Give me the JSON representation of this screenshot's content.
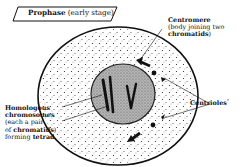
{
  "title": {
    "bold": "Prophase",
    "rest": " (early stage)"
  },
  "labels": {
    "centromere": {
      "title": "Centromere",
      "line1": "(body joining two",
      "line2_bold": "chromatids",
      "line2_rest": ")"
    },
    "centrioles": {
      "title": "Centrioles",
      "suffix": "*"
    },
    "homologous": {
      "line1": "Homologous",
      "line2": "chromosomes",
      "line3": "(each a pair",
      "line4_pre": "of ",
      "line4_bold": "chromatids",
      "line4_post": ")",
      "line5_pre": "forming ",
      "line5_bold": "tetrad",
      "line5_post": "."
    }
  },
  "colors": {
    "ink": "#111111",
    "background": "#ffffff",
    "nucleus_fill": "#9a9a9a"
  }
}
